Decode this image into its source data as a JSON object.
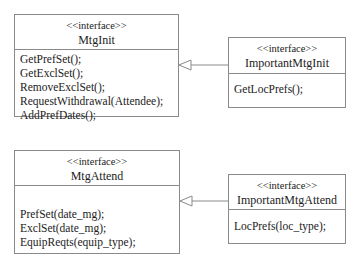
{
  "diagram": {
    "type": "UML class diagram (interfaces)",
    "interfaces": [
      {
        "id": "mtginit",
        "stereotype": "<<interface>>",
        "name": "MtgInit",
        "operations": [
          "GetPrefSet();",
          "GetExclSet();",
          "RemoveExclSet();",
          "RequestWithdrawal(Attendee);",
          "AddPrefDates();"
        ]
      },
      {
        "id": "importantmtginit",
        "stereotype": "<<interface>>",
        "name": "ImportantMtgInit",
        "operations": [
          "GetLocPrefs();"
        ]
      },
      {
        "id": "mtgattend",
        "stereotype": "<<interface>>",
        "name": "MtgAttend",
        "operations": [
          "PrefSet(date_mg);",
          "ExclSet(date_mg);",
          "EquipReqts(equip_type);"
        ]
      },
      {
        "id": "importantmtgattend",
        "stereotype": "<<interface>>",
        "name": "ImportantMtgAttend",
        "operations": [
          "LocPrefs(loc_type);"
        ]
      }
    ],
    "relationships": [
      {
        "from": "ImportantMtgInit",
        "to": "MtgInit",
        "kind": "generalization"
      },
      {
        "from": "ImportantMtgAttend",
        "to": "MtgAttend",
        "kind": "generalization"
      }
    ],
    "colors": {
      "line": "#8a8a8a",
      "text": "#222222",
      "background": "#ffffff"
    }
  }
}
